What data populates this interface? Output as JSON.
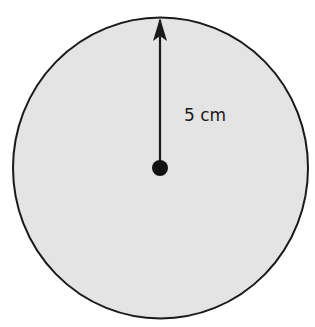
{
  "diagram": {
    "shape": "circle",
    "radius_label": "5 cm",
    "colors": {
      "fill": "#e4e4e4",
      "stroke": "#1a1a1a",
      "background": "#ffffff"
    }
  }
}
